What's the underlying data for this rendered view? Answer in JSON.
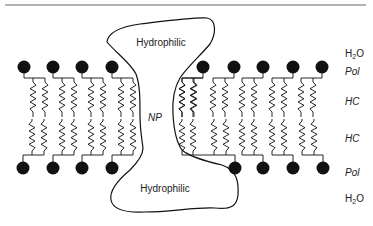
{
  "diagram": {
    "regions": {
      "top_hydrophilic": "Hydrophilic",
      "bottom_hydrophilic": "Hydrophilic",
      "core": "NP"
    },
    "layer_labels": [
      {
        "id": "h2o-top",
        "text": "H",
        "sub": "2",
        "tail": "O"
      },
      {
        "id": "pol-top",
        "text": "Pol"
      },
      {
        "id": "hc-top",
        "text": "HC"
      },
      {
        "id": "hc-bottom",
        "text": "HC"
      },
      {
        "id": "pol-bottom",
        "text": "Pol"
      },
      {
        "id": "h2o-bottom",
        "text": "H",
        "sub": "2",
        "tail": "O"
      }
    ],
    "lipids": {
      "top_left_count": 4,
      "top_right_count": 5,
      "bottom_left_count": 4,
      "bottom_right_count": 4
    },
    "colors": {
      "ink": "#111111",
      "rule": "#555555",
      "background": "#ffffff"
    }
  }
}
